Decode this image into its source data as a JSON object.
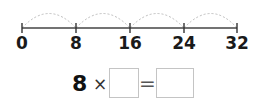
{
  "number_line": {
    "labels": [
      "0",
      "8",
      "16",
      "24",
      "32"
    ],
    "positions": [
      22,
      76,
      130,
      184,
      237
    ],
    "jump_size": 8,
    "arc_color": "#bdbdbd",
    "line_color": "#333333"
  },
  "equation": {
    "factor": "8",
    "operator": "×",
    "equals": "=",
    "blank1": "",
    "blank2": ""
  }
}
